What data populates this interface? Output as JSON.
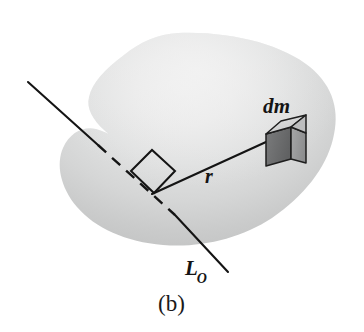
{
  "figure": {
    "caption": "(b)",
    "kind": "physics-diagram",
    "labels": {
      "mass_element": "dm",
      "radius": "r",
      "axis_main": "L",
      "axis_subscript": "O"
    },
    "colors": {
      "body_fill_light": "#ececec",
      "body_fill_mid": "#dadada",
      "body_fill_edge": "#c4c5c5",
      "line": "#141414",
      "cube_top": "#d5d6d6",
      "cube_front": "#6f7071",
      "cube_side": "#9a9b9c",
      "cube_outline": "#1e1e1e",
      "background": "#ffffff",
      "text": "#141414"
    },
    "geometry": {
      "axis_line": {
        "start_x": 28,
        "start_y": 82,
        "end_x": 228,
        "end_y": 272,
        "dash_start_x": 98,
        "dash_start_y": 145,
        "dash_end_x": 172,
        "dash_end_y": 213,
        "style_outside": "solid",
        "style_inside": "dashed"
      },
      "radius_line": {
        "start_x": 156,
        "start_y": 193,
        "end_x": 265,
        "end_y": 143,
        "style": "solid"
      },
      "right_angle_marker": {
        "corner_x": 156,
        "corner_y": 193,
        "size": 26
      },
      "cube": {
        "center_x": 283,
        "center_y": 141,
        "width": 40,
        "height": 40
      }
    }
  }
}
